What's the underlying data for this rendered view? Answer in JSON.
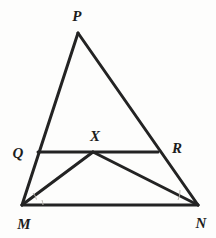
{
  "figure": {
    "background_color": "#fdfdfc",
    "stroke_color": "#232323",
    "arc_color": "#b9b5ae",
    "label_color": "#1d1d1d",
    "stroke_width": 3.0,
    "arc_width": 1.0,
    "width": 216,
    "height": 238
  },
  "points": {
    "P": {
      "label": "P",
      "x": 78,
      "y": 33,
      "label_x": 77,
      "label_y": 16
    },
    "M": {
      "label": "M",
      "x": 22,
      "y": 205,
      "label_x": 24,
      "label_y": 224
    },
    "N": {
      "label": "N",
      "x": 198,
      "y": 205,
      "label_x": 201,
      "label_y": 223
    },
    "Q": {
      "label": "Q",
      "x": 38,
      "y": 152,
      "label_x": 18,
      "label_y": 153
    },
    "R": {
      "label": "R",
      "x": 158,
      "y": 152,
      "label_x": 177,
      "label_y": 148
    },
    "X": {
      "label": "X",
      "x": 93,
      "y": 152,
      "label_x": 95,
      "label_y": 136
    }
  },
  "segments": [
    {
      "name": "segment-PM",
      "from": "P",
      "to": "M"
    },
    {
      "name": "segment-PN",
      "from": "P",
      "to": "N"
    },
    {
      "name": "segment-MN",
      "from": "M",
      "to": "N"
    },
    {
      "name": "segment-QR",
      "from": "Q",
      "to": "R"
    },
    {
      "name": "segment-XM",
      "from": "X",
      "to": "M"
    },
    {
      "name": "segment-XN",
      "from": "X",
      "to": "N"
    }
  ],
  "angle_marks": [
    {
      "name": "angle-arc-QMX",
      "vertex": "M",
      "path": "M 33 193 A 14 14 0 0 1 36.5 199.5"
    },
    {
      "name": "angle-arc-XMN",
      "vertex": "M",
      "path": "M 42 200 A 21 21 0 0 1 43 205"
    },
    {
      "name": "angle-arc-XNM",
      "vertex": "N",
      "path": "M 180 190 A 20 20 0 0 1 178 200"
    }
  ]
}
